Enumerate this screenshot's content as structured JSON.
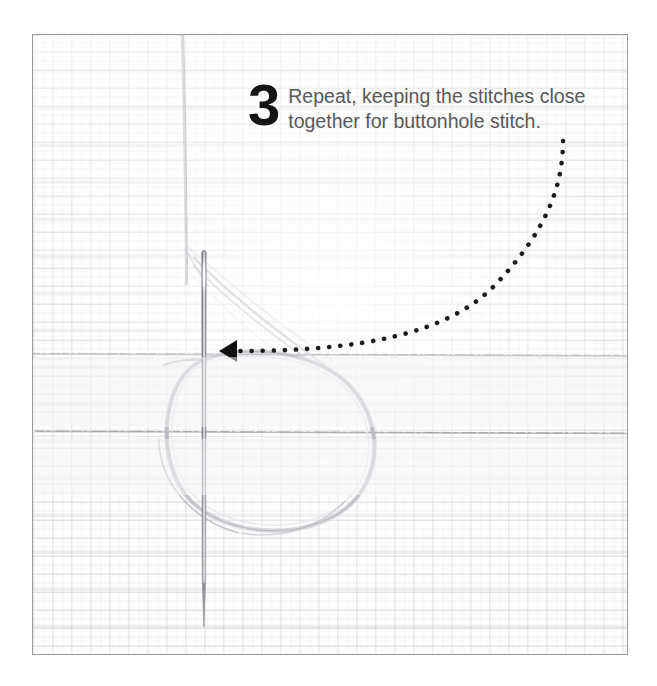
{
  "image": {
    "kind": "instructional-photo",
    "subject": "buttonhole stitch embroidery demonstration",
    "alt": "Needle pushed through white aida fabric with a loose thread loop, illustrating step 3 of the buttonhole stitch."
  },
  "frame": {
    "border_color": "#9a9a9a",
    "background_color": "#fbfbfb"
  },
  "caption": {
    "step_number": "3",
    "lines": [
      "Repeat, keeping the stitches close",
      "together for buttonhole stitch."
    ],
    "full_text": "Repeat, keeping the stitches close together for buttonhole stitch.",
    "number_color": "#151515",
    "text_color": "#58585a"
  },
  "annotation": {
    "arrow_label": "pointer-arrow",
    "arrow_color": "#111111",
    "dotted_path_color": "#1d1d1d",
    "dot_count": 58,
    "description": "Dotted curved leader line from the caption down and left to an arrowhead at the needle."
  },
  "elements": {
    "needle_label": "sewing-needle",
    "needle_color": "#8f9398",
    "thread_loop_label": "thread-loop",
    "thread_color": "#c9ccd0",
    "stitch_line_label": "worked-stitch-row",
    "fabric_label": "aida-cloth"
  }
}
